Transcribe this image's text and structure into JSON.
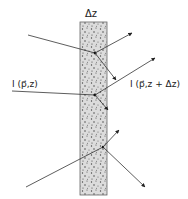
{
  "figure": {
    "slab_label": "Δz",
    "incident_label": "I (p⃗,z)",
    "transmitted_label": "I (p⃗,z + Δz)",
    "colors": {
      "slab_fill": "#d9d9d9",
      "slab_border": "#555555",
      "line": "#333333",
      "dots": "#444444"
    }
  },
  "elements": {
    "slab": {
      "x": 80,
      "y": 22,
      "width": 27,
      "height": 173
    },
    "rays": [
      {
        "name": "ray-top-incoming",
        "from": [
          28,
          35
        ],
        "to": [
          95,
          53
        ],
        "arrow": false
      },
      {
        "name": "ray-top-scatter-up",
        "from": [
          95,
          53
        ],
        "to": [
          132,
          33
        ],
        "arrow": true
      },
      {
        "name": "ray-top-scatter-down",
        "from": [
          95,
          53
        ],
        "to": [
          116,
          80
        ],
        "arrow": true
      },
      {
        "name": "ray-mid-incoming",
        "from": [
          12,
          91
        ],
        "to": [
          95,
          95
        ],
        "arrow": false
      },
      {
        "name": "ray-mid-scatter-up",
        "from": [
          95,
          95
        ],
        "to": [
          155,
          58
        ],
        "arrow": true
      },
      {
        "name": "ray-bottom-incoming",
        "from": [
          26,
          187
        ],
        "to": [
          103,
          147
        ],
        "arrow": false
      },
      {
        "name": "ray-bottom-scatter-up",
        "from": [
          103,
          147
        ],
        "to": [
          119,
          130
        ],
        "arrow": true
      },
      {
        "name": "ray-bottom-scatter-down",
        "from": [
          103,
          147
        ],
        "to": [
          145,
          187
        ],
        "arrow": true
      }
    ]
  }
}
